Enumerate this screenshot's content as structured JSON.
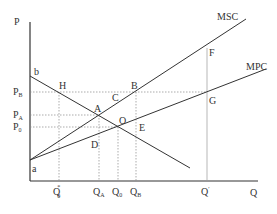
{
  "axes": {
    "y_label": "P",
    "x_label": "Q"
  },
  "curves": {
    "msc": "MSC",
    "mpc": "MPC",
    "demand_top": "b",
    "origin_point": "a"
  },
  "points": {
    "H": "H",
    "B": "B",
    "C": "C",
    "A": "A",
    "O": "O",
    "E": "E",
    "D": "D",
    "F": "F",
    "G": "G"
  },
  "y_ticks": [
    {
      "main": "P",
      "sub": "B"
    },
    {
      "main": "P",
      "sub": "A"
    },
    {
      "main": "P",
      "sub": "0"
    }
  ],
  "x_ticks": [
    {
      "main": "Q",
      "sub": "0",
      "sup": "*"
    },
    {
      "main": "Q",
      "sub": "A"
    },
    {
      "main": "Q",
      "sub": "0"
    },
    {
      "main": "Q",
      "sub": "B"
    },
    {
      "main": "Q",
      "sup": "′"
    }
  ],
  "colors": {
    "line": "#333333",
    "dashed": "#888888",
    "background": "#ffffff"
  }
}
